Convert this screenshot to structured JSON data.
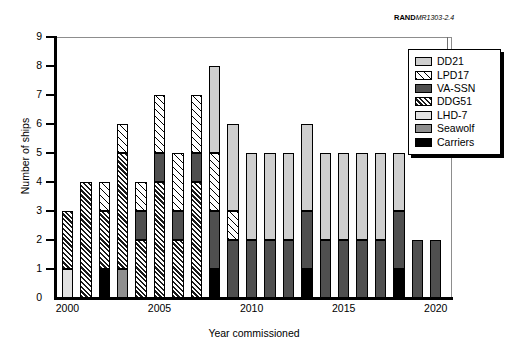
{
  "credit": {
    "org": "RAND",
    "doc": "MR1303-2.4"
  },
  "chart_data": {
    "type": "bar",
    "stacked": true,
    "title": "",
    "xlabel": "Year commissioned",
    "ylabel": "Number of ships",
    "ylim": [
      0,
      9
    ],
    "yticks": [
      "0",
      "1",
      "2",
      "3",
      "4",
      "5",
      "6",
      "7",
      "8",
      "9"
    ],
    "xticks": [
      "2000",
      "2005",
      "2010",
      "2015",
      "2020"
    ],
    "grid": false,
    "legend_position": "upper right",
    "categories": [
      "2000",
      "2001",
      "2002",
      "2003",
      "2004",
      "2005",
      "2006",
      "2007",
      "2008",
      "2009",
      "2010",
      "2011",
      "2012",
      "2013",
      "2014",
      "2015",
      "2016",
      "2017",
      "2018",
      "2019",
      "2020"
    ],
    "series": [
      {
        "name": "Carriers",
        "color": "#000000",
        "pattern": "solid-black",
        "values": [
          0,
          0,
          1,
          0,
          0,
          0,
          0,
          0,
          1,
          0,
          0,
          0,
          0,
          1,
          0,
          0,
          0,
          0,
          1,
          0,
          0
        ]
      },
      {
        "name": "Seawolf",
        "color": "#8f8f8f",
        "pattern": "solid-mid-gray",
        "values": [
          0,
          0,
          0,
          1,
          0,
          0,
          0,
          0,
          0,
          0,
          0,
          0,
          0,
          0,
          0,
          0,
          0,
          0,
          0,
          0,
          0
        ]
      },
      {
        "name": "LHD-7",
        "color": "#e2e2e2",
        "pattern": "solid-light-gray",
        "values": [
          1,
          0,
          0,
          0,
          0,
          0,
          0,
          0,
          0,
          0,
          0,
          0,
          0,
          0,
          0,
          0,
          0,
          0,
          0,
          0,
          0
        ]
      },
      {
        "name": "DDG51",
        "color": "#ffffff",
        "pattern": "dense-diagonal-hatch",
        "values": [
          2,
          4,
          2,
          4,
          2,
          4,
          2,
          4,
          0,
          0,
          0,
          0,
          0,
          0,
          0,
          0,
          0,
          0,
          0,
          0,
          0
        ]
      },
      {
        "name": "VA-SSN",
        "color": "#4f4f4f",
        "pattern": "solid-dark-gray",
        "values": [
          0,
          0,
          0,
          0,
          1,
          1,
          1,
          1,
          2,
          2,
          2,
          2,
          2,
          2,
          2,
          2,
          2,
          2,
          2,
          2,
          2
        ]
      },
      {
        "name": "LPD17",
        "color": "#ffffff",
        "pattern": "wide-diagonal-hatch",
        "values": [
          0,
          0,
          1,
          1,
          1,
          2,
          2,
          2,
          2,
          1,
          0,
          0,
          0,
          0,
          0,
          0,
          0,
          0,
          0,
          0,
          0
        ]
      },
      {
        "name": "DD21",
        "color": "#cfcfcf",
        "pattern": "solid-gray",
        "values": [
          0,
          0,
          0,
          0,
          0,
          0,
          0,
          0,
          3,
          3,
          3,
          3,
          3,
          3,
          3,
          3,
          3,
          3,
          2,
          0,
          0
        ]
      }
    ],
    "totals": [
      3,
      4,
      4,
      6,
      4,
      7,
      5,
      7,
      8,
      6,
      5,
      5,
      5,
      6,
      5,
      5,
      5,
      5,
      5,
      2,
      2
    ]
  },
  "legend": {
    "entries": [
      {
        "label": "DD21",
        "swatch": "solid-gray"
      },
      {
        "label": "LPD17",
        "swatch": "wide-diagonal-hatch"
      },
      {
        "label": "VA-SSN",
        "swatch": "solid-dark-gray"
      },
      {
        "label": "DDG51",
        "swatch": "dense-diagonal-hatch"
      },
      {
        "label": "LHD-7",
        "swatch": "solid-light-gray"
      },
      {
        "label": "Seawolf",
        "swatch": "solid-mid-gray"
      },
      {
        "label": "Carriers",
        "swatch": "solid-black"
      }
    ]
  }
}
